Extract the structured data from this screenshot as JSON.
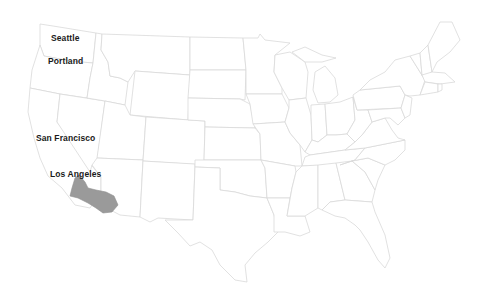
{
  "map": {
    "title": "United States",
    "colors": {
      "background": "#ffffff",
      "state_fill": "#ffffff",
      "state_border": "#d9d9d9",
      "highlight_fill": "#9a9a9a",
      "label": "#1a1a1a"
    },
    "highlighted_region": "Southern California (Los Angeles area)",
    "cities": [
      {
        "name": "Seattle",
        "x": 51,
        "y": 37
      },
      {
        "name": "Portland",
        "x": 48,
        "y": 59
      },
      {
        "name": "San Francisco",
        "x": 36,
        "y": 136
      },
      {
        "name": "Los Angeles",
        "x": 50,
        "y": 172
      }
    ]
  }
}
